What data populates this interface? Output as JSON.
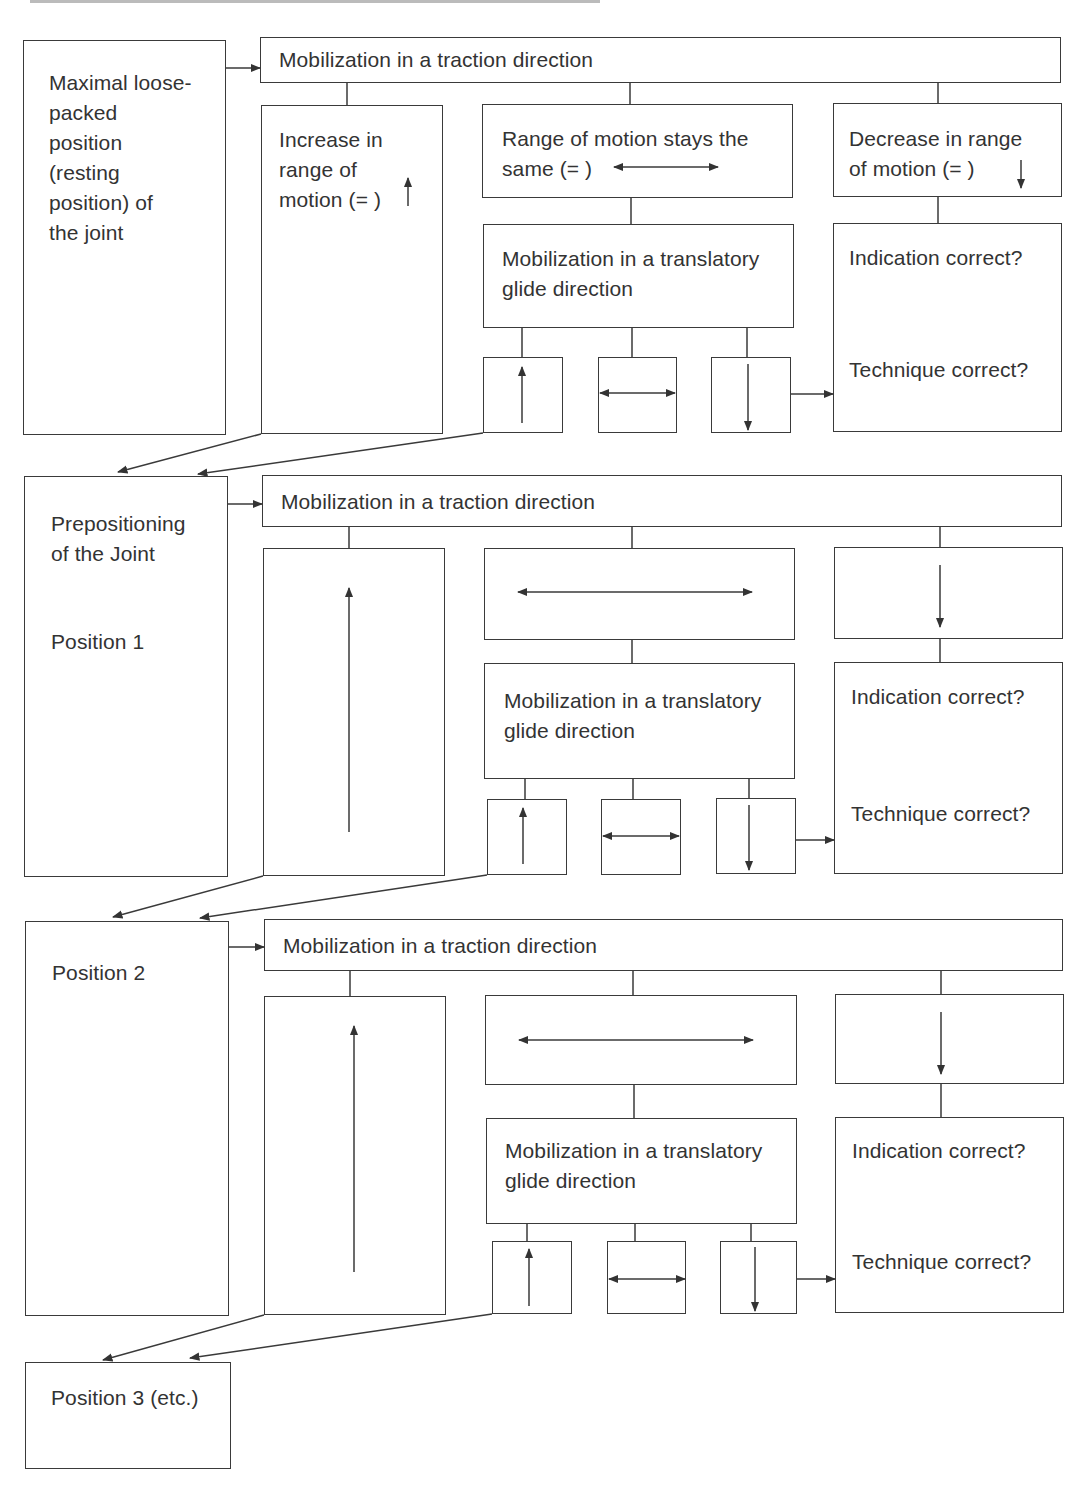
{
  "diagram": {
    "cropped_header": "",
    "sections": [
      {
        "id": "start",
        "left_box": "Maximal loose-\n   packed\n   position\n   (resting\n   position) of\n   the joint",
        "traction": "Mobilization in a traction direction",
        "increase": "Increase in\n   range of\n   motion (=  )",
        "same": "Range of motion stays the\n   same (=              )",
        "decrease": "Decrease in range\n   of motion (=     )",
        "glide": "Mobilization in a translatory\n   glide direction",
        "indication": "Indication correct?",
        "technique": "Technique correct?"
      },
      {
        "id": "position-1",
        "left_box_title": "Prepositioning\n   of the Joint",
        "left_box_sub": "Position 1",
        "traction": "Mobilization in a traction direction",
        "glide": "Mobilization in a translatory\n   glide direction",
        "indication": "Indication correct?",
        "technique": "Technique correct?"
      },
      {
        "id": "position-2",
        "left_box": "Position 2",
        "traction": "Mobilization in a traction direction",
        "glide": "Mobilization in a translatory\n   glide direction",
        "indication": "Indication correct?",
        "technique": "Technique correct?"
      }
    ],
    "final_box": "Position 3 (etc.)",
    "colors": {
      "line": "#3a3a3a",
      "text": "#333333",
      "background": "#ffffff"
    }
  }
}
